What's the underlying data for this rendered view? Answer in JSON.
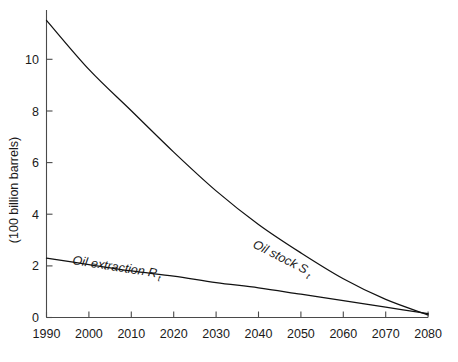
{
  "chart_data": {
    "type": "line",
    "title": "",
    "xlabel": "",
    "ylabel": "(100 billion barrels)",
    "x": [
      1990,
      2000,
      2010,
      2020,
      2030,
      2040,
      2050,
      2060,
      2070,
      2080
    ],
    "xtick_labels": [
      "1990",
      "2000",
      "2010",
      "2020",
      "2030",
      "2040",
      "2050",
      "2060",
      "2070",
      "2080"
    ],
    "ytick_labels": [
      "0",
      "2",
      "4",
      "6",
      "8",
      "10"
    ],
    "yticks": [
      0,
      2,
      4,
      6,
      8,
      10
    ],
    "xlim": [
      1990,
      2080
    ],
    "ylim": [
      0,
      11.9
    ],
    "grid": false,
    "legend_position": "inline-curve-labels",
    "series": [
      {
        "name": "Oil stock S",
        "name_subscript": "t",
        "label_text": "Oil stock S",
        "label_subscript": "t",
        "values": [
          11.5,
          9.6,
          8.0,
          6.4,
          4.9,
          3.6,
          2.5,
          1.5,
          0.7,
          0.1
        ],
        "style": "convex-decreasing-curve",
        "color": "#111111"
      },
      {
        "name": "Oil extraction R",
        "name_subscript": "t",
        "label_text": "Oil extraction R",
        "label_subscript": "t",
        "values": [
          2.3,
          2.05,
          1.8,
          1.6,
          1.35,
          1.15,
          0.9,
          0.65,
          0.4,
          0.15
        ],
        "style": "near-linear-decreasing",
        "color": "#111111"
      }
    ],
    "annotations": [
      {
        "text": "Oil stock S",
        "subscript": "t",
        "attached_to": "Oil stock S",
        "rotation_deg": 27
      },
      {
        "text": "Oil extraction R",
        "subscript": "t",
        "attached_to": "Oil extraction R",
        "rotation_deg": 9
      }
    ]
  },
  "colors": {
    "background": "#ffffff",
    "axis": "#4a4a4a",
    "curve": "#111111",
    "text": "#1a1a1a"
  }
}
